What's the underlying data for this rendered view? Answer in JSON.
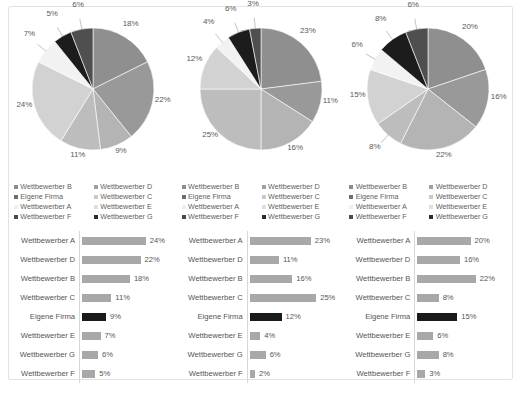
{
  "legend": {
    "entries": [
      {
        "label": "Wettbewerber B",
        "color": "#8c8c8c"
      },
      {
        "label": "Eigene Firma",
        "color": "#6e6e6e"
      },
      {
        "label": "Wettbewerber A",
        "color": "#efefef"
      },
      {
        "label": "Wettbewerber F",
        "color": "#4a4a4a"
      },
      {
        "label": "Wettbewerber D",
        "color": "#a0a0a0"
      },
      {
        "label": "Wettbewerber C",
        "color": "#c9c9c9"
      },
      {
        "label": "Wettbewerber E",
        "color": "#e0e0e0"
      },
      {
        "label": "Wettbewerber G",
        "color": "#2b2b2b"
      }
    ]
  },
  "colors": {
    "bar": "#a8a8a8",
    "bar_own": "#1a1a1a",
    "card_border": "#e2e2e2",
    "text": "#545454"
  },
  "chart_data": [
    {
      "type": "pie",
      "title": "",
      "panel": 1,
      "categories": [
        "Wettbewerber B",
        "Eigene Firma",
        "Wettbewerber A",
        "Wettbewerber F",
        "Wettbewerber D",
        "Wettbewerber C",
        "Wettbewerber E",
        "Wettbewerber G"
      ],
      "slices": [
        {
          "label": "18%",
          "value": 18,
          "color": "#8f8f8f"
        },
        {
          "label": "22%",
          "value": 22,
          "color": "#999999"
        },
        {
          "label": "9%",
          "value": 9,
          "color": "#b4b4b4"
        },
        {
          "label": "11%",
          "value": 11,
          "color": "#bdbdbd"
        },
        {
          "label": "24%",
          "value": 24,
          "color": "#d2d2d2"
        },
        {
          "label": "7%",
          "value": 7,
          "color": "#f2f2f2"
        },
        {
          "label": "5%",
          "value": 5,
          "color": "#1c1c1c"
        },
        {
          "label": "6%",
          "value": 6,
          "color": "#4f4f4f"
        }
      ],
      "legend_position": "bottom"
    },
    {
      "type": "pie",
      "title": "",
      "panel": 2,
      "categories": [
        "Wettbewerber B",
        "Eigene Firma",
        "Wettbewerber A",
        "Wettbewerber F",
        "Wettbewerber D",
        "Wettbewerber C",
        "Wettbewerber E",
        "Wettbewerber G"
      ],
      "slices": [
        {
          "label": "23%",
          "value": 23,
          "color": "#8f8f8f"
        },
        {
          "label": "11%",
          "value": 11,
          "color": "#999999"
        },
        {
          "label": "16%",
          "value": 16,
          "color": "#b4b4b4"
        },
        {
          "label": "25%",
          "value": 25,
          "color": "#bdbdbd"
        },
        {
          "label": "12%",
          "value": 12,
          "color": "#d2d2d2"
        },
        {
          "label": "4%",
          "value": 4,
          "color": "#f2f2f2"
        },
        {
          "label": "6%",
          "value": 6,
          "color": "#1c1c1c"
        },
        {
          "label": "3%",
          "value": 3,
          "color": "#4f4f4f"
        }
      ],
      "legend_position": "bottom"
    },
    {
      "type": "pie",
      "title": "",
      "panel": 3,
      "categories": [
        "Wettbewerber B",
        "Eigene Firma",
        "Wettbewerber A",
        "Wettbewerber F",
        "Wettbewerber D",
        "Wettbewerber C",
        "Wettbewerber E",
        "Wettbewerber G"
      ],
      "slices": [
        {
          "label": "20%",
          "value": 20,
          "color": "#8f8f8f"
        },
        {
          "label": "16%",
          "value": 16,
          "color": "#999999"
        },
        {
          "label": "22%",
          "value": 22,
          "color": "#b4b4b4"
        },
        {
          "label": "8%",
          "value": 8,
          "color": "#bdbdbd"
        },
        {
          "label": "15%",
          "value": 15,
          "color": "#d2d2d2"
        },
        {
          "label": "6%",
          "value": 6,
          "color": "#f2f2f2"
        },
        {
          "label": "8%",
          "value": 8,
          "color": "#1c1c1c"
        },
        {
          "label": "6%",
          "value": 6,
          "color": "#4f4f4f"
        }
      ],
      "legend_position": "bottom"
    },
    {
      "type": "bar",
      "orientation": "horizontal",
      "panel": 1,
      "categories": [
        "Wettbewerber A",
        "Wettbewerber D",
        "Wettbewerber B",
        "Wettbewerber C",
        "Eigene Firma",
        "Wettbewerber E",
        "Wettbewerber G",
        "Wettbewerber F"
      ],
      "values": [
        24,
        22,
        18,
        11,
        9,
        7,
        6,
        5
      ],
      "labels": [
        "24%",
        "22%",
        "18%",
        "11%",
        "9%",
        "7%",
        "6%",
        "5%"
      ],
      "highlight_index": 4,
      "xlim": [
        0,
        26
      ]
    },
    {
      "type": "bar",
      "orientation": "horizontal",
      "panel": 2,
      "categories": [
        "Wettbewerber A",
        "Wettbewerber D",
        "Wettbewerber B",
        "Wettbewerber C",
        "Eigene Firma",
        "Wettbewerber E",
        "Wettbewerber G",
        "Wettbewerber F"
      ],
      "values": [
        23,
        11,
        16,
        25,
        12,
        4,
        6,
        2
      ],
      "labels": [
        "23%",
        "11%",
        "16%",
        "25%",
        "12%",
        "4%",
        "6%",
        "2%"
      ],
      "highlight_index": 4,
      "xlim": [
        0,
        26
      ]
    },
    {
      "type": "bar",
      "orientation": "horizontal",
      "panel": 3,
      "categories": [
        "Wettbewerber A",
        "Wettbewerber D",
        "Wettbewerber B",
        "Wettbewerber C",
        "Eigene Firma",
        "Wettbewerber E",
        "Wettbewerber G",
        "Wettbewerber F"
      ],
      "values": [
        20,
        16,
        22,
        8,
        15,
        6,
        8,
        3
      ],
      "labels": [
        "20%",
        "16%",
        "22%",
        "8%",
        "15%",
        "6%",
        "8%",
        "3%"
      ],
      "highlight_index": 4,
      "xlim": [
        0,
        26
      ]
    }
  ]
}
